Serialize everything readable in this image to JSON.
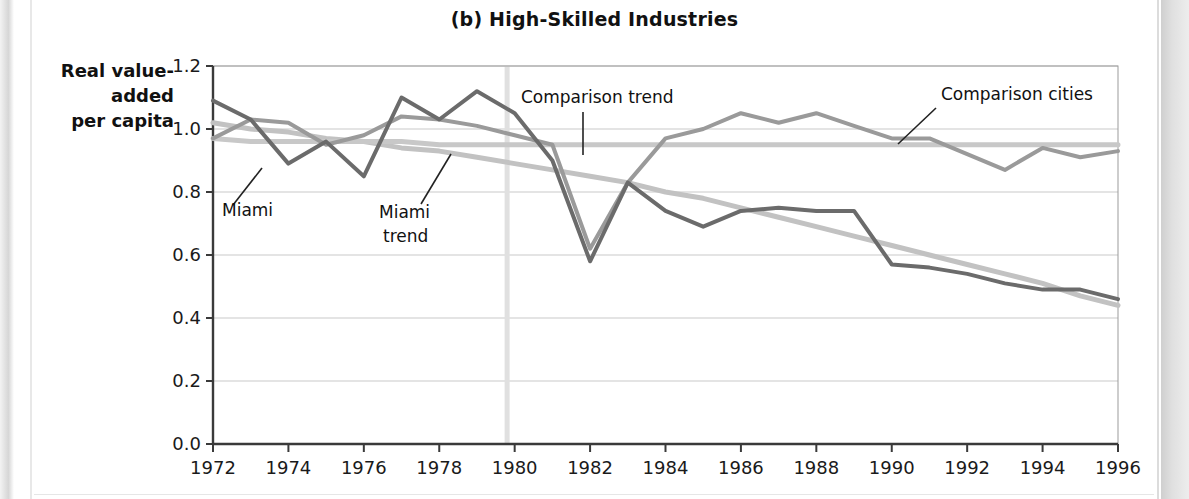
{
  "figure": {
    "title": "(b) High-Skilled Industries",
    "ylabel_line1": "Real value-",
    "ylabel_line2": "added",
    "ylabel_line3": "per capita"
  },
  "annotations": {
    "miami": "Miami",
    "miami_trend_line1": "Miami",
    "miami_trend_line2": "trend",
    "comparison_trend": "Comparison trend",
    "comparison_cities": "Comparison cities"
  },
  "colors": {
    "miami": "#6b6b6b",
    "comparison_cities": "#9a9a9a",
    "miami_trend": "#c2c2c2",
    "comparison_trend": "#c8c8c8",
    "grid": "#c9c9c9",
    "axis": "#3a3a3a",
    "event_line": "#e0e0e0",
    "plot_bg": "#ffffff"
  },
  "chart_data": {
    "type": "line",
    "title": "(b) High-Skilled Industries",
    "xlabel": "",
    "ylabel": "Real value-added per capita",
    "xlim": [
      1972,
      1996
    ],
    "ylim": [
      0.0,
      1.2
    ],
    "grid": true,
    "legend": "inline-annotations",
    "yticks": [
      "0.0",
      "0.2",
      "0.4",
      "0.6",
      "0.8",
      "1.0",
      "1.2"
    ],
    "ytick_values": [
      0.0,
      0.2,
      0.4,
      0.6,
      0.8,
      1.0,
      1.2
    ],
    "xticks": [
      "1972",
      "1974",
      "1976",
      "1978",
      "1980",
      "1982",
      "1984",
      "1986",
      "1988",
      "1990",
      "1992",
      "1994",
      "1996"
    ],
    "xtick_values": [
      1972,
      1974,
      1976,
      1978,
      1980,
      1982,
      1984,
      1986,
      1988,
      1990,
      1992,
      1994,
      1996
    ],
    "event_marker": {
      "label": "",
      "x": 1979.8
    },
    "x": [
      1972,
      1973,
      1974,
      1975,
      1976,
      1977,
      1978,
      1979,
      1980,
      1981,
      1982,
      1983,
      1984,
      1985,
      1986,
      1987,
      1988,
      1989,
      1990,
      1991,
      1992,
      1993,
      1994,
      1995,
      1996
    ],
    "series": [
      {
        "name": "Miami",
        "color": "#6b6b6b",
        "width": 4,
        "values": [
          1.09,
          1.03,
          0.89,
          0.96,
          0.85,
          1.1,
          1.03,
          1.12,
          1.05,
          0.9,
          0.58,
          0.83,
          0.74,
          0.69,
          0.74,
          0.75,
          0.74,
          0.74,
          0.57,
          0.56,
          0.54,
          0.51,
          0.49,
          0.49,
          0.46
        ]
      },
      {
        "name": "Comparison cities",
        "color": "#9a9a9a",
        "width": 4,
        "values": [
          0.97,
          1.03,
          1.02,
          0.95,
          0.98,
          1.04,
          1.03,
          1.01,
          0.98,
          0.95,
          0.62,
          0.83,
          0.97,
          1.0,
          1.05,
          1.02,
          1.05,
          1.01,
          0.97,
          0.97,
          0.92,
          0.87,
          0.94,
          0.91,
          0.93
        ]
      },
      {
        "name": "Miami trend",
        "color": "#c2c2c2",
        "width": 5,
        "values": [
          1.02,
          1.0,
          0.99,
          0.97,
          0.96,
          0.94,
          0.93,
          0.91,
          0.89,
          0.87,
          0.85,
          0.83,
          0.8,
          0.78,
          0.75,
          0.72,
          0.69,
          0.66,
          0.63,
          0.6,
          0.57,
          0.54,
          0.51,
          0.47,
          0.44
        ]
      },
      {
        "name": "Comparison trend",
        "color": "#c8c8c8",
        "width": 5,
        "values": [
          0.97,
          0.96,
          0.96,
          0.96,
          0.96,
          0.96,
          0.95,
          0.95,
          0.95,
          0.95,
          0.95,
          0.95,
          0.95,
          0.95,
          0.95,
          0.95,
          0.95,
          0.95,
          0.95,
          0.95,
          0.95,
          0.95,
          0.95,
          0.95,
          0.95
        ]
      }
    ]
  }
}
